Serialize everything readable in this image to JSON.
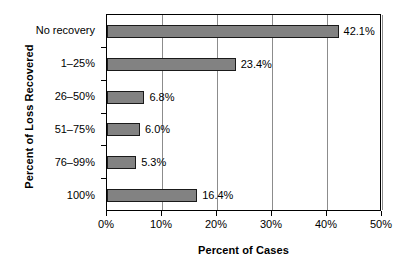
{
  "chart_data": {
    "type": "bar",
    "orientation": "horizontal",
    "title": "",
    "xlabel": "Percent of Cases",
    "ylabel": "Percent of Loss Recovered",
    "categories": [
      "No recovery",
      "1–25%",
      "26–50%",
      "51–75%",
      "76–99%",
      "100%"
    ],
    "values": [
      42.1,
      23.4,
      6.8,
      6.0,
      5.3,
      16.4
    ],
    "value_labels": [
      "42.1%",
      "23.4%",
      "6.8%",
      "6.0%",
      "5.3%",
      "16.4%"
    ],
    "xlim": [
      0,
      50
    ],
    "xticks": [
      0,
      10,
      20,
      30,
      40,
      50
    ],
    "xtick_labels": [
      "0%",
      "10%",
      "20%",
      "30%",
      "40%",
      "50%"
    ],
    "grid": "vertical",
    "legend": "none",
    "bar_fill_color": "#828282",
    "bar_border_color": "#1a1a1a",
    "gridline_color": "#8c8c8c",
    "axis_color": "#000000",
    "background_color": "#ffffff"
  }
}
